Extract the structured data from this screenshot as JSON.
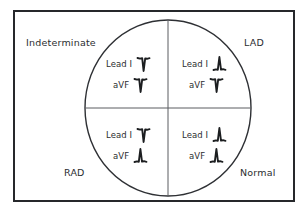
{
  "diagram": {
    "frame_color": "#26282b",
    "line_color": "#3a3c40",
    "text_color": "#2b2d30",
    "background": "#ffffff"
  },
  "quadrants": {
    "upper_left": {
      "label": "Indeterminate",
      "lead_one": {
        "name": "Lead I",
        "deflection": "negative",
        "glyph": "qrs-negative-icon"
      },
      "avf": {
        "name": "aVF",
        "deflection": "negative",
        "glyph": "qrs-negative-icon"
      }
    },
    "upper_right": {
      "label": "LAD",
      "lead_one": {
        "name": "Lead I",
        "deflection": "positive",
        "glyph": "qrs-positive-icon"
      },
      "avf": {
        "name": "aVF",
        "deflection": "negative",
        "glyph": "qrs-negative-icon"
      }
    },
    "lower_left": {
      "label": "RAD",
      "lead_one": {
        "name": "Lead I",
        "deflection": "negative",
        "glyph": "qrs-negative-icon"
      },
      "avf": {
        "name": "aVF",
        "deflection": "positive",
        "glyph": "qrs-positive-icon"
      }
    },
    "lower_right": {
      "label": "Normal",
      "lead_one": {
        "name": "Lead I",
        "deflection": "positive",
        "glyph": "qrs-positive-icon"
      },
      "avf": {
        "name": "aVF",
        "deflection": "positive",
        "glyph": "qrs-positive-icon"
      }
    }
  }
}
